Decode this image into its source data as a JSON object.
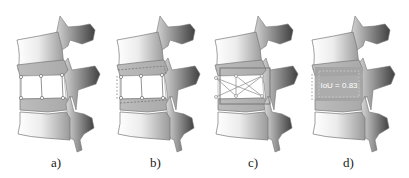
{
  "figure": {
    "panels": [
      {
        "id": "a",
        "label": "a)",
        "overlay": "corner-keypoints"
      },
      {
        "id": "b",
        "label": "b)",
        "overlay": "dashed-boundary-keypoints"
      },
      {
        "id": "c",
        "label": "c)",
        "overlay": "bounding-box-diagonals"
      },
      {
        "id": "d",
        "label": "d)",
        "overlay": "iou-region",
        "iou_text": "IoU = 0.83"
      }
    ]
  },
  "colors": {
    "bone_light": "#f4f4f4",
    "bone_dark": "#5a5a5a",
    "disc": "#b9b9b9",
    "outline": "#6e6e6e",
    "iou_fill": "#a8a8a8"
  }
}
